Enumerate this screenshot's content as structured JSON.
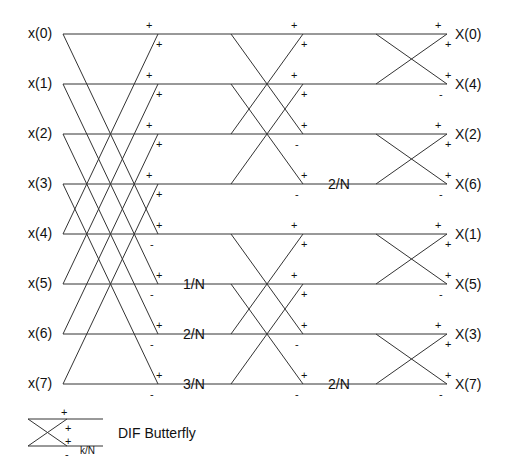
{
  "inputs": [
    "x(0)",
    "x(1)",
    "x(2)",
    "x(3)",
    "x(4)",
    "x(5)",
    "x(6)",
    "x(7)"
  ],
  "outputs": [
    "X(0)",
    "X(4)",
    "X(2)",
    "X(6)",
    "X(1)",
    "X(5)",
    "X(3)",
    "X(7)"
  ],
  "stages": [
    {
      "name": "stage-1",
      "span": 4,
      "twiddles": [
        {
          "row": 5,
          "label": "1/N"
        },
        {
          "row": 6,
          "label": "2/N"
        },
        {
          "row": 7,
          "label": "3/N"
        }
      ]
    },
    {
      "name": "stage-2",
      "span": 2,
      "twiddles": [
        {
          "row": 3,
          "label": "2/N"
        },
        {
          "row": 7,
          "label": "2/N"
        }
      ]
    },
    {
      "name": "stage-3",
      "span": 1,
      "twiddles": []
    }
  ],
  "signs": {
    "plus": "+",
    "minus": "-"
  },
  "legend": {
    "label": "DIF Butterfly",
    "twiddle": "k/N",
    "signs": [
      "+",
      "+",
      "+",
      "-"
    ]
  },
  "colors": {
    "line": "#333333",
    "text": "#111111",
    "background": "#ffffff"
  }
}
